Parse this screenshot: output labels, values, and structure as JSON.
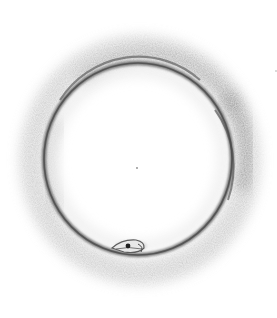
{
  "image": {
    "subject": "Pencil sketch of an ouroboros (snake forming a circle, biting its own tail)",
    "width": 277,
    "height": 318,
    "colors": {
      "background": "#ffffff",
      "ring_stroke": "#5a5a5a",
      "ring_shadow": "#bdbdbd",
      "eye": "#1e1e1e"
    },
    "ring": {
      "cx": 138,
      "cy": 159,
      "rx": 94,
      "ry": 96
    },
    "head": {
      "cx": 131,
      "cy": 246,
      "eye_cx": 128,
      "eye_cy": 246
    },
    "marks": [
      {
        "name": "center-dot",
        "cx": 137,
        "cy": 168
      },
      {
        "name": "corner-speck",
        "cx": 276,
        "cy": 71
      }
    ]
  }
}
